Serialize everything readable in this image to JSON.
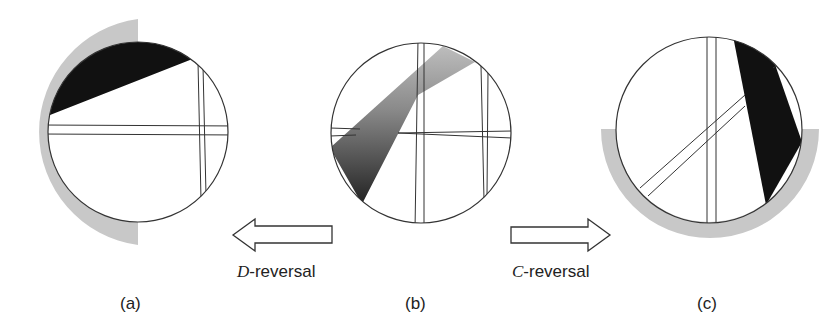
{
  "panels": [
    {
      "id": "a",
      "label": "(a)"
    },
    {
      "id": "b",
      "label": "(b)"
    },
    {
      "id": "c",
      "label": "(c)"
    }
  ],
  "arrows": [
    {
      "direction": "left",
      "italic_prefix": "D",
      "suffix": "-reversal"
    },
    {
      "direction": "right",
      "italic_prefix": "C",
      "suffix": "-reversal"
    }
  ],
  "colors": {
    "outline": "#333333",
    "grey_arc": "#c8c8c8",
    "black_band": "#111111",
    "wedge_light": "#b5b5b5",
    "wedge_dark": "#2a2a2a"
  }
}
